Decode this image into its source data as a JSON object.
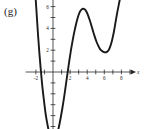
{
  "panel": {
    "label": "(g)"
  },
  "chart_data": {
    "type": "line",
    "title": "",
    "subtitle": "",
    "xlabel": "x",
    "ylabel": "y",
    "xlim": [
      -3.2,
      9.6
    ],
    "ylim": [
      -7.6,
      7.4
    ],
    "grid": false,
    "legend": null,
    "annotations": [],
    "x_ticks": [
      -2,
      -1,
      1,
      2,
      3,
      4,
      5,
      6,
      7,
      8,
      9
    ],
    "x_tick_labels": [
      {
        "value": -2,
        "text": "-2"
      },
      {
        "value": 2,
        "text": "2"
      },
      {
        "value": 4,
        "text": "4"
      },
      {
        "value": 6,
        "text": "6"
      },
      {
        "value": 8,
        "text": "8"
      }
    ],
    "y_ticks": [
      -6,
      -5,
      -4,
      -3,
      -2,
      -1,
      1,
      2,
      3,
      4,
      5,
      6
    ],
    "y_tick_labels": [
      {
        "value": 6,
        "text": "6"
      },
      {
        "value": 4,
        "text": "4"
      },
      {
        "value": 2,
        "text": "2"
      },
      {
        "value": -6,
        "text": "-6"
      }
    ],
    "series": [
      {
        "name": "polynomial",
        "color": "#1a1a1a",
        "x": [
          -2.05,
          -1.9,
          -1.75,
          -1.6,
          -1.45,
          -1.3,
          -1.15,
          -1.0,
          -0.85,
          -0.7,
          -0.55,
          -0.4,
          -0.2,
          0.0,
          0.2,
          0.35,
          0.5,
          0.7,
          0.9,
          1.1,
          1.3,
          1.5,
          1.7,
          1.9,
          2.1,
          2.3,
          2.5,
          2.7,
          2.9,
          3.1,
          3.3,
          3.5,
          3.7,
          3.9,
          4.1,
          4.3,
          4.5,
          4.7,
          4.9,
          5.1,
          5.3,
          5.5,
          5.7,
          5.9,
          6.1,
          6.3,
          6.5,
          6.7,
          6.9,
          7.1,
          7.3,
          7.5,
          7.7,
          7.9
        ],
        "y": [
          7.0,
          5.2,
          3.4,
          1.8,
          0.4,
          -0.9,
          -2.0,
          -3.0,
          -3.9,
          -4.6,
          -5.2,
          -5.6,
          -5.95,
          -6.1,
          -6.05,
          -5.9,
          -5.6,
          -5.0,
          -4.2,
          -3.3,
          -2.3,
          -1.2,
          -0.1,
          1.0,
          2.0,
          2.9,
          3.7,
          4.4,
          5.0,
          5.45,
          5.7,
          5.8,
          5.75,
          5.55,
          5.2,
          4.75,
          4.25,
          3.7,
          3.2,
          2.75,
          2.4,
          2.1,
          1.95,
          1.85,
          1.8,
          1.85,
          2.0,
          2.35,
          2.9,
          3.6,
          4.5,
          5.4,
          6.2,
          7.0
        ]
      }
    ],
    "key_points": {
      "left_local_min": {
        "x": 0.0,
        "y": -6.1
      },
      "local_max": {
        "x": 3.5,
        "y": 5.8
      },
      "right_local_min": {
        "x": 6.2,
        "y": 1.8
      },
      "x_intercepts": [
        -1.5,
        1.72
      ],
      "y_intercept": -6.1
    }
  }
}
